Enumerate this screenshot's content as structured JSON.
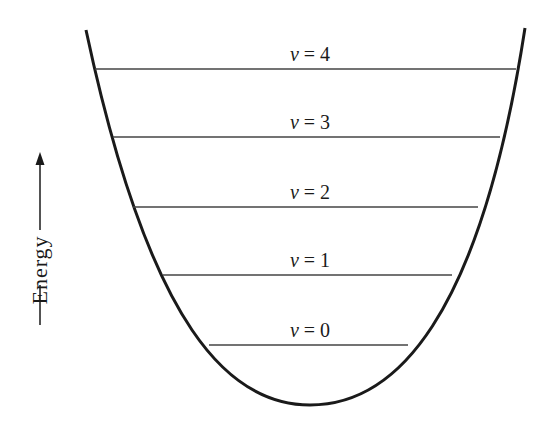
{
  "diagram": {
    "axis_label": "Energy",
    "curve": {
      "type": "parabola",
      "left_top": [
        86,
        30
      ],
      "right_top": [
        525,
        28
      ],
      "minimum": [
        310,
        405
      ],
      "color": "#1a1a1a"
    },
    "levels": [
      {
        "label": "v = 4",
        "quantum_number": "4",
        "y": 69,
        "x1": 95,
        "x2": 516
      },
      {
        "label": "v = 3",
        "quantum_number": "3",
        "y": 137,
        "x1": 113,
        "x2": 500
      },
      {
        "label": "v = 2",
        "quantum_number": "2",
        "y": 207,
        "x1": 133,
        "x2": 478
      },
      {
        "label": "v = 1",
        "quantum_number": "1",
        "y": 275,
        "x1": 163,
        "x2": 452
      },
      {
        "label": "v = 0",
        "quantum_number": "0",
        "y": 345,
        "x1": 209,
        "x2": 408
      }
    ],
    "line_color": "#444444"
  }
}
